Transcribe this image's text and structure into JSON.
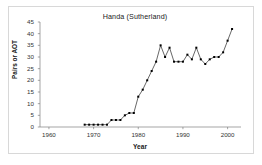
{
  "figure": {
    "background_color": "#ffffff",
    "border_color": "#d8d8d8",
    "axis_color": "#808080",
    "series_color": "#000000",
    "marker_color": "#000000"
  },
  "chart_data": {
    "type": "line",
    "title": "Handa (Sutherland)",
    "xlabel": "Year",
    "ylabel": "Pairs or AOT",
    "xlim": [
      1958,
      2003
    ],
    "ylim": [
      0,
      45
    ],
    "xticks": [
      1960,
      1970,
      1980,
      1990,
      2000
    ],
    "yticks": [
      0,
      5,
      10,
      15,
      20,
      25,
      30,
      35,
      40,
      45
    ],
    "grid": false,
    "legend": "none",
    "markers": "filled-square",
    "x": [
      1968,
      1969,
      1970,
      1971,
      1972,
      1973,
      1974,
      1975,
      1976,
      1977,
      1978,
      1979,
      1980,
      1981,
      1982,
      1983,
      1984,
      1985,
      1986,
      1987,
      1988,
      1989,
      1990,
      1991,
      1992,
      1993,
      1994,
      1995,
      1996,
      1997,
      1998,
      1999,
      2000,
      2001
    ],
    "values": [
      1,
      1,
      1,
      1,
      1,
      1,
      3,
      3,
      3,
      5,
      6,
      6,
      13,
      16,
      20,
      24,
      28,
      35,
      30,
      34,
      28,
      28,
      28,
      31,
      29,
      34,
      29,
      27,
      29,
      30,
      30,
      32,
      37,
      42
    ],
    "series": [
      {
        "name": "Pairs or AOT",
        "values": [
          1,
          1,
          1,
          1,
          1,
          1,
          3,
          3,
          3,
          5,
          6,
          6,
          13,
          16,
          20,
          24,
          28,
          35,
          30,
          34,
          28,
          28,
          28,
          31,
          29,
          34,
          29,
          27,
          29,
          30,
          30,
          32,
          37,
          42
        ]
      }
    ]
  }
}
